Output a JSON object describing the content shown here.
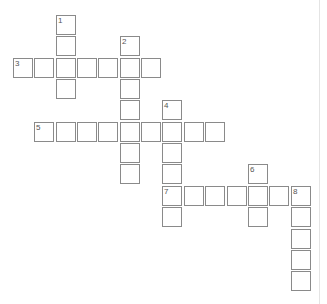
{
  "puzzle": {
    "origin_x": 13,
    "origin_y": 15,
    "pitch": 21.35,
    "words": [
      {
        "number": "1",
        "direction": "down",
        "row": 0,
        "col": 2,
        "length": 4
      },
      {
        "number": "2",
        "direction": "down",
        "row": 1,
        "col": 5,
        "length": 7
      },
      {
        "number": "3",
        "direction": "across",
        "row": 2,
        "col": 0,
        "length": 7
      },
      {
        "number": "4",
        "direction": "down",
        "row": 4,
        "col": 7,
        "length": 6
      },
      {
        "number": "5",
        "direction": "across",
        "row": 5,
        "col": 1,
        "length": 9
      },
      {
        "number": "6",
        "direction": "down",
        "row": 7,
        "col": 11,
        "length": 3
      },
      {
        "number": "7",
        "direction": "across",
        "row": 8,
        "col": 7,
        "length": 7
      },
      {
        "number": "8",
        "direction": "down",
        "row": 8,
        "col": 13,
        "length": 5
      }
    ]
  }
}
